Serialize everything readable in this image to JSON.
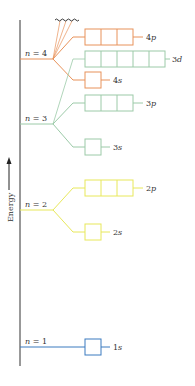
{
  "diagram": {
    "axis_label": "Energy",
    "colors": {
      "n1": "#3a7bbf",
      "n2": "#e8e85a",
      "n3": "#9ccaa8",
      "n4": "#e8925a",
      "axis": "#333333"
    },
    "levels": [
      {
        "label": "n = 4",
        "orbitals": [
          {
            "name": "4p",
            "boxes": 3
          },
          {
            "name": "3d",
            "boxes": 5
          },
          {
            "name": "4s",
            "boxes": 1
          }
        ]
      },
      {
        "label": "n = 3",
        "orbitals": [
          {
            "name": "3p",
            "boxes": 3
          },
          {
            "name": "3s",
            "boxes": 1
          }
        ]
      },
      {
        "label": "n = 2",
        "orbitals": [
          {
            "name": "2p",
            "boxes": 3
          },
          {
            "name": "2s",
            "boxes": 1
          }
        ]
      },
      {
        "label": "n = 1",
        "orbitals": [
          {
            "name": "1s",
            "boxes": 1
          }
        ]
      }
    ]
  }
}
